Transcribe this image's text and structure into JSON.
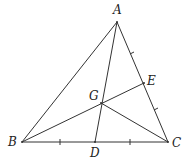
{
  "diagram": {
    "type": "triangle-medians",
    "points": {
      "A": {
        "label": "A",
        "x": 117,
        "y": 22
      },
      "B": {
        "label": "B",
        "x": 22,
        "y": 142
      },
      "C": {
        "label": "C",
        "x": 168,
        "y": 142
      },
      "D": {
        "label": "D",
        "x": 95,
        "y": 142
      },
      "E": {
        "label": "E",
        "x": 144,
        "y": 83
      },
      "G": {
        "label": "G",
        "x": 101,
        "y": 103
      }
    },
    "segments": [
      "AB",
      "AC",
      "BC",
      "AD",
      "BE",
      "GC"
    ],
    "tick_marks": {
      "BC": "single ticks marking BD = DC",
      "AC": "small marks marking AE = EC"
    },
    "stroke_color": "#333333"
  }
}
